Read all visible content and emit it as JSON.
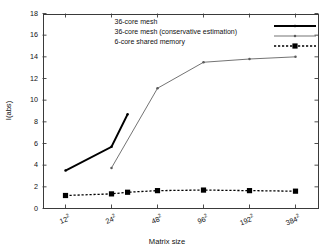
{
  "chart_data": {
    "type": "line",
    "title": "",
    "xlabel": "Matrix size",
    "ylabel": "I(abs)",
    "categories": [
      "12²",
      "24²",
      "48²",
      "96²",
      "192²",
      "384²"
    ],
    "x_tick_labels": [
      {
        "base": "12",
        "exp": "2"
      },
      {
        "base": "24",
        "exp": "2"
      },
      {
        "base": "48",
        "exp": "2"
      },
      {
        "base": "96",
        "exp": "2"
      },
      {
        "base": "192",
        "exp": "2"
      },
      {
        "base": "384",
        "exp": "2"
      }
    ],
    "y_tick_labels": [
      "0",
      "2",
      "4",
      "6",
      "8",
      "10",
      "12",
      "14",
      "16",
      "18"
    ],
    "ylim": [
      0,
      18
    ],
    "ystep": 2,
    "grid": false,
    "legend_position": "top-center",
    "series": [
      {
        "name": "36-core mesh",
        "color": "#000000",
        "style": "solid-thick",
        "marker": "dot",
        "x": [
          0,
          1,
          1.35
        ],
        "values": [
          3.5,
          5.7,
          8.7
        ]
      },
      {
        "name": "36-core mesh (conservative estimation)",
        "color": "#5a5a5a",
        "style": "solid-thin",
        "marker": "dot",
        "x": [
          1,
          2,
          3,
          4,
          5
        ],
        "values": [
          3.75,
          11.1,
          13.5,
          13.8,
          14.0
        ]
      },
      {
        "name": "6-core shared memory",
        "color": "#000000",
        "style": "dotted",
        "marker": "square",
        "x": [
          0,
          1,
          1.35,
          2,
          3,
          4,
          5
        ],
        "values": [
          1.2,
          1.35,
          1.5,
          1.65,
          1.7,
          1.65,
          1.6
        ]
      }
    ]
  },
  "legend": {
    "entries": [
      {
        "label": "36-core mesh"
      },
      {
        "label": "36-core mesh (conservative estimation)"
      },
      {
        "label": "6-core shared memory"
      }
    ]
  }
}
